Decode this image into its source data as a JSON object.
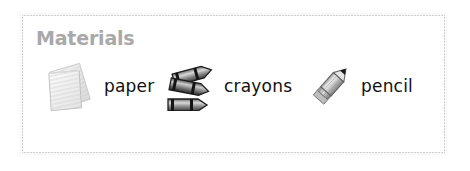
{
  "panel": {
    "title": "Materials",
    "title_color": "#a9a9a9",
    "border_color": "#b9b9b9",
    "background_color": "#ffffff"
  },
  "materials": [
    {
      "label": "paper",
      "icon": "lined-paper-stack-icon"
    },
    {
      "label": "crayons",
      "icon": "crayons-icon"
    },
    {
      "label": "pencil",
      "icon": "pencil-icon"
    }
  ]
}
